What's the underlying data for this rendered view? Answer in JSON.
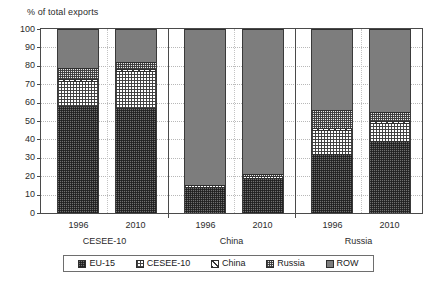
{
  "chart_data": {
    "type": "bar",
    "subtype": "stacked-column",
    "title": "",
    "ylabel": "% of total exports",
    "xlabel": "",
    "ylim": [
      0,
      100
    ],
    "ytick_labels": [
      "0",
      "10",
      "20",
      "30",
      "40",
      "50",
      "60",
      "70",
      "80",
      "90",
      "100"
    ],
    "ytick_values": [
      0,
      10,
      20,
      30,
      40,
      50,
      60,
      70,
      80,
      90,
      100
    ],
    "grid": true,
    "legend_position": "bottom",
    "groups": [
      "CESEE-10",
      "China",
      "Russia"
    ],
    "categories": [
      "1996",
      "2010",
      "1996",
      "2010",
      "1996",
      "2010"
    ],
    "series": [
      {
        "name": "EU-15",
        "color": "#6f6f6f",
        "pattern": "dense-speckle",
        "values": [
          58,
          57,
          14,
          19,
          32,
          39
        ]
      },
      {
        "name": "CESEE-10",
        "color": "#ffffff",
        "pattern": "checkerboard",
        "values": [
          14,
          20,
          1,
          1,
          13,
          10
        ]
      },
      {
        "name": "China",
        "color": "#ffffff",
        "pattern": "diagonal-hatch",
        "values": [
          1,
          1,
          0,
          0,
          1,
          1
        ]
      },
      {
        "name": "Russia",
        "color": "#e8e8e8",
        "pattern": "fine-dot-grid",
        "values": [
          6,
          4,
          0,
          1,
          10,
          5
        ]
      },
      {
        "name": "ROW",
        "color": "#7d7d7d",
        "pattern": "solid-grey",
        "values": [
          21,
          18,
          85,
          79,
          44,
          45
        ]
      }
    ],
    "legend": [
      "EU-15",
      "CESEE-10",
      "China",
      "Russia",
      "ROW"
    ]
  }
}
